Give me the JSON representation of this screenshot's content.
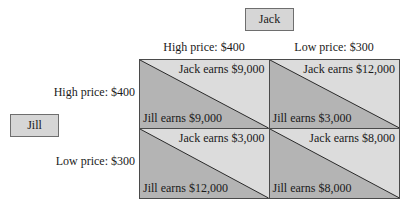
{
  "players": {
    "column_player": "Jack",
    "row_player": "Jill"
  },
  "columns": [
    {
      "label": "High price: $400"
    },
    {
      "label": "Low price: $300"
    }
  ],
  "rows": [
    {
      "label": "High price: $400"
    },
    {
      "label": "Low price: $300"
    }
  ],
  "cells": [
    [
      {
        "jack": "Jack earns $9,000",
        "jill": "Jill earns $9,000"
      },
      {
        "jack": "Jack earns $12,000",
        "jill": "Jill earns $3,000"
      }
    ],
    [
      {
        "jack": "Jack earns $3,000",
        "jill": "Jill earns $12,000"
      },
      {
        "jack": "Jack earns $8,000",
        "jill": "Jill earns $8,000"
      }
    ]
  ],
  "colors": {
    "jack_region": "#dcdcdc",
    "jill_region": "#b4b4b4",
    "player_box": "#d6d6d6",
    "border": "#4a4a4a"
  }
}
